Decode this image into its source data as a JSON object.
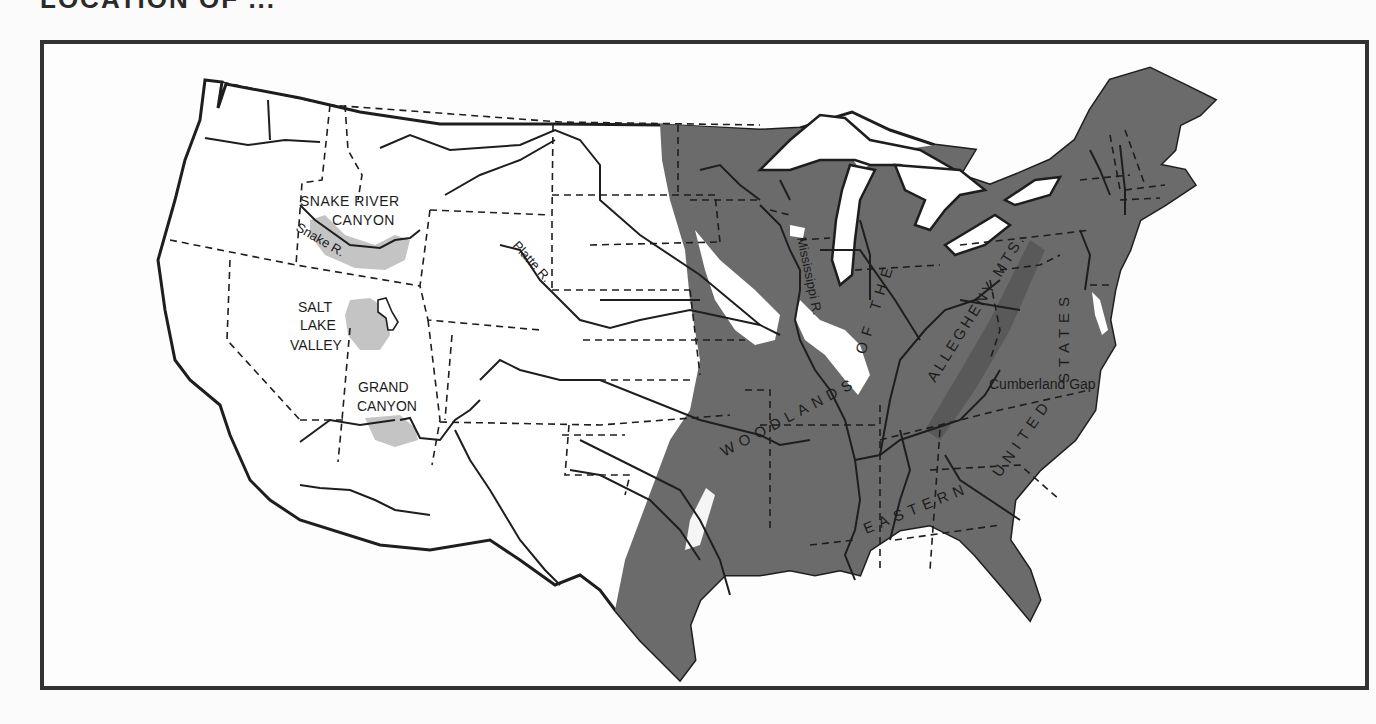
{
  "title": "LOCATION OF ...",
  "map": {
    "region": "United States (contiguous)",
    "legend_colors": {
      "woodlands": "#6b6b6b",
      "allegheny_ridge": "#5a5a5a",
      "highlighted_sites": "#c4c4c4",
      "land": "#ffffff",
      "outline": "#1e1e1e"
    },
    "labels": {
      "snake_river_canyon_line1": "SNAKE RIVER",
      "snake_river_canyon_line2": "CANYON",
      "snake_river": "Snake R.",
      "salt_lake_line1": "SALT",
      "salt_lake_line2": "LAKE",
      "salt_lake_line3": "VALLEY",
      "grand_canyon_line1": "GRAND",
      "grand_canyon_line2": "CANYON",
      "platte_river": "Platte R.",
      "mississippi_river": "Mississippi R.",
      "woodlands": "WOODLANDS",
      "of_the": "OF THE",
      "allegheny": "ALLEGHENY MTS.",
      "eastern": "EASTERN",
      "united": "UNITED",
      "states": "STATES",
      "cumberland_gap": "Cumberland Gap"
    }
  }
}
